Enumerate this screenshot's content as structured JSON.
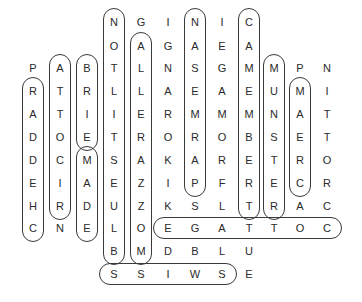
{
  "puzzle": {
    "type": "word-search",
    "col_x": [
      33,
      60,
      87,
      114,
      141,
      168,
      195,
      222,
      249,
      274,
      300,
      327
    ],
    "row_y": [
      22,
      46,
      68,
      91,
      114,
      137,
      160,
      183,
      206,
      228,
      251,
      274
    ],
    "grid": [
      [
        "",
        "",
        "",
        "N",
        "G",
        "I",
        "N",
        "I",
        "C",
        "",
        "",
        ""
      ],
      [
        "",
        "",
        "",
        "O",
        "A",
        "G",
        "A",
        "E",
        "A",
        "",
        "",
        ""
      ],
      [
        "P",
        "A",
        "B",
        "T",
        "L",
        "N",
        "S",
        "G",
        "M",
        "M",
        "P",
        "N"
      ],
      [
        "R",
        "T",
        "R",
        "L",
        "L",
        "A",
        "E",
        "A",
        "E",
        "U",
        "M",
        "I"
      ],
      [
        "A",
        "T",
        "I",
        "I",
        "E",
        "R",
        "M",
        "M",
        "M",
        "N",
        "A",
        "T"
      ],
      [
        "D",
        "O",
        "E",
        "T",
        "R",
        "O",
        "R",
        "O",
        "B",
        "S",
        "E",
        "T"
      ],
      [
        "D",
        "C",
        "M",
        "S",
        "A",
        "K",
        "A",
        "R",
        "E",
        "T",
        "R",
        "O"
      ],
      [
        "E",
        "I",
        "A",
        "E",
        "Z",
        "I",
        "P",
        "F",
        "R",
        "E",
        "C",
        "R"
      ],
      [
        "H",
        "R",
        "D",
        "U",
        "Z",
        "K",
        "S",
        "L",
        "T",
        "R",
        "A",
        "C"
      ],
      [
        "C",
        "N",
        "E",
        "L",
        "O",
        "E",
        "G",
        "A",
        "T",
        "T",
        "O",
        "C"
      ],
      [
        "",
        "",
        "",
        "B",
        "M",
        "D",
        "B",
        "L",
        "U",
        "",
        "",
        ""
      ],
      [
        "",
        "",
        "",
        "S",
        "S",
        "I",
        "W",
        "S",
        "E",
        "",
        "",
        ""
      ]
    ],
    "found_words": [
      {
        "word": "CHEDDAR",
        "dir": "v",
        "col": 0,
        "row_start": 3,
        "row_end": 9
      },
      {
        "word": "RICOTTA",
        "dir": "v",
        "col": 1,
        "row_start": 2,
        "row_end": 8
      },
      {
        "word": "BRIE",
        "dir": "v",
        "col": 2,
        "row_start": 2,
        "row_end": 5
      },
      {
        "word": "EDAM",
        "dir": "v",
        "col": 2,
        "row_start": 6,
        "row_end": 9
      },
      {
        "word": "BLUE STILTON",
        "dir": "v",
        "col": 3,
        "row_start": 0,
        "row_end": 10
      },
      {
        "word": "MOZZARELLA",
        "dir": "v",
        "col": 4,
        "row_start": 1,
        "row_end": 10
      },
      {
        "word": "PARMESAN",
        "dir": "v",
        "col": 6,
        "row_start": 0,
        "row_end": 7
      },
      {
        "word": "CAMEMBERT",
        "dir": "v",
        "col": 8,
        "row_start": 0,
        "row_end": 8
      },
      {
        "word": "MUNSTER",
        "dir": "v",
        "col": 9,
        "row_start": 2,
        "row_end": 8
      },
      {
        "word": "CREAM",
        "dir": "v",
        "col": 10,
        "row_start": 3,
        "row_end": 7
      },
      {
        "word": "COTTAGE",
        "dir": "h",
        "row": 9,
        "col_start": 5,
        "col_end": 11
      },
      {
        "word": "SWISS",
        "dir": "h",
        "row": 11,
        "col_start": 3,
        "col_end": 7
      }
    ],
    "colors": {
      "letter": "#2a2a2a",
      "outline": "#3a3a3a",
      "background": "#ffffff"
    }
  }
}
